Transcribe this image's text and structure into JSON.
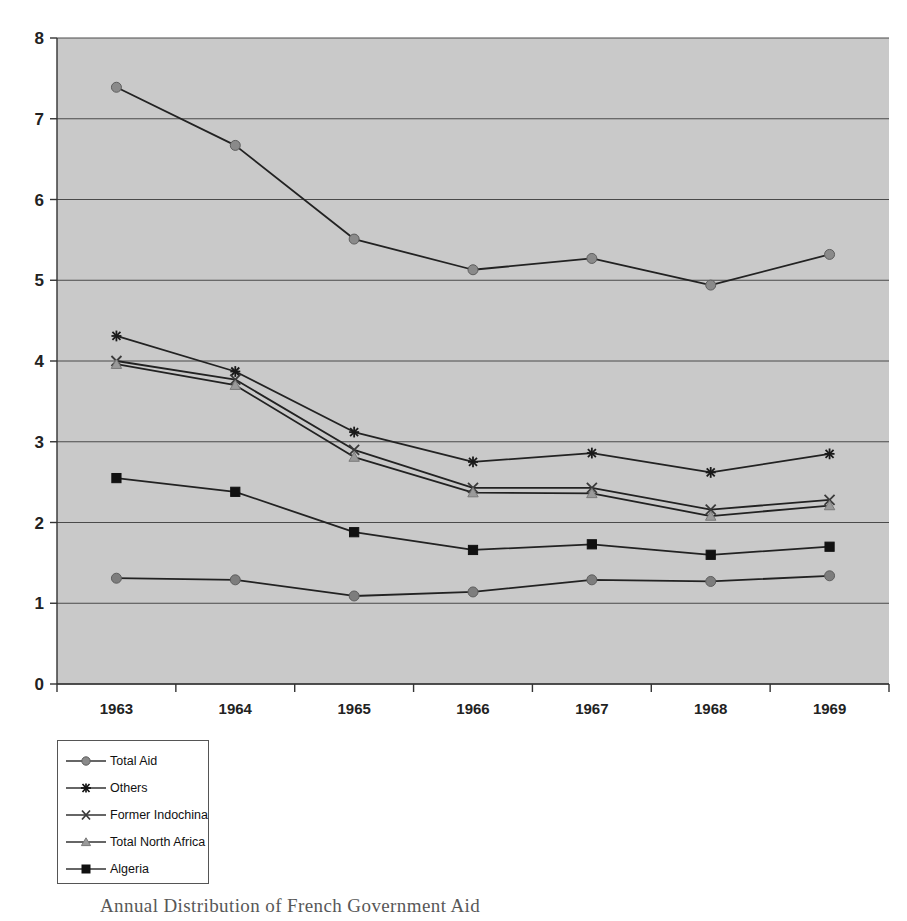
{
  "chart_data": {
    "type": "line",
    "title": "",
    "xlabel": "",
    "ylabel": "",
    "categories": [
      "1963",
      "1964",
      "1965",
      "1966",
      "1967",
      "1968",
      "1969"
    ],
    "ylim": [
      0,
      8
    ],
    "yticks": [
      "0",
      "1",
      "2",
      "3",
      "4",
      "5",
      "6",
      "7",
      "8"
    ],
    "grid": true,
    "legend_position": "below-left",
    "plot_background": "#c9c9c9",
    "line_color": "#222222",
    "series": [
      {
        "name": "Total Aid",
        "marker": "circle",
        "marker_color": "#8a8a8a",
        "values": [
          7.39,
          6.67,
          5.51,
          5.13,
          5.27,
          4.94,
          5.32
        ]
      },
      {
        "name": "Others",
        "marker": "asterisk",
        "marker_color": "#1a1a1a",
        "values": [
          4.31,
          3.87,
          3.12,
          2.75,
          2.86,
          2.62,
          2.85
        ]
      },
      {
        "name": "Former Indochina",
        "marker": "cross",
        "marker_color": "#3a3a3a",
        "values": [
          4.0,
          3.77,
          2.9,
          2.43,
          2.43,
          2.16,
          2.28
        ]
      },
      {
        "name": "Total North Africa",
        "marker": "triangle",
        "marker_color": "#9a9a9a",
        "values": [
          3.96,
          3.7,
          2.81,
          2.37,
          2.36,
          2.08,
          2.21
        ]
      },
      {
        "name": "Algeria",
        "marker": "square",
        "marker_color": "#111111",
        "values": [
          2.55,
          2.38,
          1.88,
          1.66,
          1.73,
          1.6,
          1.7
        ]
      },
      {
        "name": "Total Aid Lower",
        "marker": "circle",
        "marker_color": "#7d7d7d",
        "values": [
          1.31,
          1.29,
          1.09,
          1.14,
          1.29,
          1.27,
          1.34
        ],
        "hidden_from_legend": true
      }
    ]
  },
  "legend": {
    "entries": [
      {
        "label": "Total Aid",
        "marker": "circle"
      },
      {
        "label": "Others",
        "marker": "asterisk"
      },
      {
        "label": "Former Indochina",
        "marker": "cross"
      },
      {
        "label": "Total North Africa",
        "marker": "triangle"
      },
      {
        "label": "Algeria",
        "marker": "square"
      }
    ]
  },
  "caption": {
    "text": "Annual Distribution of French Government Aid"
  }
}
